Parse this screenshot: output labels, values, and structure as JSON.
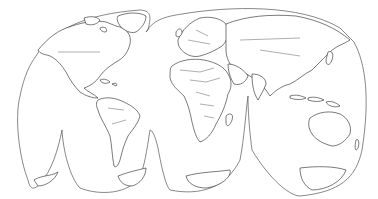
{
  "map": {
    "projection": "interrupted-homolosine",
    "style": "outline",
    "background_color": "#ffffff",
    "line_color": "#222222",
    "lobes": {
      "north": [
        "americas",
        "eurasia-africa"
      ],
      "south": [
        "pacific-east",
        "south-america",
        "africa",
        "indian-australia"
      ]
    },
    "regions": [
      "north-america",
      "greenland",
      "south-america",
      "europe",
      "africa",
      "asia",
      "australia",
      "new-zealand",
      "antarctica",
      "madagascar",
      "indonesia",
      "japan",
      "british-isles",
      "caribbean"
    ]
  }
}
